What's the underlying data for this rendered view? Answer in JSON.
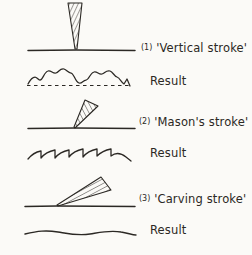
{
  "figure": {
    "background_color": "#fbfaf7",
    "ink_color": "#2b2824",
    "rows": [
      {
        "id": "vertical-stroke",
        "number": "(1)",
        "name": "Vertical stroke",
        "label": "(1) 'Vertical stroke'",
        "tool_angle_deg": 90,
        "tool_shape": "narrow hatched wedge, point down on baseline",
        "baseline_style": "straight"
      },
      {
        "id": "vertical-stroke-result",
        "label": "Result",
        "texture": "bumpy scalloped lumps above a dashed reference line"
      },
      {
        "id": "masons-stroke",
        "number": "(2)",
        "name": "Mason's stroke",
        "label": "(2) 'Mason's stroke'",
        "tool_angle_deg": 60,
        "tool_shape": "hatched wedge leaning right, point down on baseline",
        "baseline_style": "straight"
      },
      {
        "id": "masons-stroke-result",
        "label": "Result",
        "texture": "sawtooth ridges with sharp vertical drops"
      },
      {
        "id": "carving-stroke",
        "number": "(3)",
        "name": "Carving stroke",
        "label": "(3) 'Carving stroke'",
        "tool_angle_deg": 25,
        "tool_shape": "shallow hatched wedge, point at left on baseline",
        "baseline_style": "straight"
      },
      {
        "id": "carving-stroke-result",
        "label": "Result",
        "texture": "gently undulating near-flat line"
      }
    ]
  },
  "labels": {
    "vertical_num": "(1)",
    "vertical_text": "'Vertical stroke'",
    "result_1": "Result",
    "mason_num": "(2)",
    "mason_text": "'Mason's stroke'",
    "result_2": "Result",
    "carving_num": "(3)",
    "carving_text": "'Carving stroke'",
    "result_3": "Result"
  }
}
